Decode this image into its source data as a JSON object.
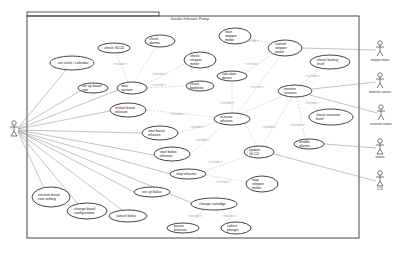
{
  "diagram": {
    "type": "uml-use-case",
    "system_title": "Insulin Infusion Pump",
    "stereotype": "<<include>>",
    "actors": [
      {
        "id": "patient",
        "label": "",
        "x": 12,
        "y": 131
      },
      {
        "id": "stepper-motor",
        "label": "stepper motor",
        "x": 380,
        "y": 50
      },
      {
        "id": "batteries-sensor",
        "label": "batteries sensor",
        "x": 380,
        "y": 83
      },
      {
        "id": "reservoir-sensor",
        "label": "reservoir sensor",
        "x": 381,
        "y": 114
      },
      {
        "id": "alarms",
        "label": "alarms",
        "x": 380,
        "y": 149
      },
      {
        "id": "lcd",
        "label": "LCD",
        "x": 380,
        "y": 181
      }
    ],
    "use_cases": [
      {
        "id": "set-clock",
        "label": "set clock / calendar",
        "cx": 72,
        "cy": 63,
        "rx": 22,
        "ry": 7
      },
      {
        "id": "check-lcd",
        "label": "check GLCD",
        "cx": 114,
        "cy": 48,
        "rx": 16,
        "ry": 5
      },
      {
        "id": "check-alarms",
        "label": "check alarms",
        "cx": 160,
        "cy": 41,
        "rx": 15,
        "ry": 6
      },
      {
        "id": "start-stepper",
        "label": "start stepper motor",
        "cx": 235,
        "cy": 36,
        "rx": 16,
        "ry": 8
      },
      {
        "id": "check-stepper",
        "label": "check stepper motor",
        "cx": 200,
        "cy": 60,
        "rx": 16,
        "ry": 8
      },
      {
        "id": "control-stepper",
        "label": "control stepper motor",
        "cx": 285,
        "cy": 48,
        "rx": 17,
        "ry": 8
      },
      {
        "id": "setup-basal",
        "label": "set up basal rate",
        "cx": 93,
        "cy": 88,
        "rx": 15,
        "ry": 5
      },
      {
        "id": "start-system",
        "label": "start system",
        "cx": 132,
        "cy": 88,
        "rx": 15,
        "ry": 6
      },
      {
        "id": "check-batteries",
        "label": "check batteries",
        "cx": 200,
        "cy": 86,
        "rx": 14,
        "ry": 5
      },
      {
        "id": "calculate-dose",
        "label": "calculate doses",
        "cx": 232,
        "cy": 76,
        "rx": 15,
        "ry": 5
      },
      {
        "id": "check-battery-level",
        "label": "check battery level",
        "cx": 330,
        "cy": 62,
        "rx": 20,
        "ry": 7
      },
      {
        "id": "restart-basal",
        "label": "restart basal infusion",
        "cx": 128,
        "cy": 110,
        "rx": 18,
        "ry": 7
      },
      {
        "id": "monitor-sensors",
        "label": "monitor sensors",
        "cx": 295,
        "cy": 91,
        "rx": 17,
        "ry": 6
      },
      {
        "id": "check-reservoir",
        "label": "check reservoir level",
        "cx": 331,
        "cy": 117,
        "rx": 22,
        "ry": 8
      },
      {
        "id": "start-basal",
        "label": "start basal infusion",
        "cx": 160,
        "cy": 133,
        "rx": 18,
        "ry": 7
      },
      {
        "id": "activate-infusion",
        "label": "activate infusion",
        "cx": 232,
        "cy": 119,
        "rx": 18,
        "ry": 6
      },
      {
        "id": "start-bolus",
        "label": "start bolus infusion",
        "cx": 172,
        "cy": 154,
        "rx": 18,
        "ry": 7
      },
      {
        "id": "update-lcd",
        "label": "update GLCD",
        "cx": 259,
        "cy": 152,
        "rx": 15,
        "ry": 6
      },
      {
        "id": "enable-alarms",
        "label": "enable alarms",
        "cx": 309,
        "cy": 144,
        "rx": 15,
        "ry": 5
      },
      {
        "id": "stop-infusion",
        "label": "stop infusion",
        "cx": 188,
        "cy": 174,
        "rx": 18,
        "ry": 5
      },
      {
        "id": "stop-stepper",
        "label": "stop stepper motor",
        "cx": 262,
        "cy": 184,
        "rx": 16,
        "ry": 8
      },
      {
        "id": "setup-bolus",
        "label": "set up bolus",
        "cx": 152,
        "cy": 192,
        "rx": 18,
        "ry": 5
      },
      {
        "id": "change-cartridge",
        "label": "change cartridge",
        "cx": 214,
        "cy": 204,
        "rx": 23,
        "ry": 6
      },
      {
        "id": "retrieve-basal",
        "label": "retrieve basal rate setting",
        "cx": 51,
        "cy": 197,
        "rx": 19,
        "ry": 10
      },
      {
        "id": "change-basal-config",
        "label": "change basal configuration",
        "cx": 87,
        "cy": 211,
        "rx": 20,
        "ry": 8
      },
      {
        "id": "cancel-bolus",
        "label": "cancel bolus",
        "cx": 128,
        "cy": 216,
        "rx": 19,
        "ry": 6
      },
      {
        "id": "pause-infusion",
        "label": "pause infusion",
        "cx": 183,
        "cy": 228,
        "rx": 16,
        "ry": 5
      },
      {
        "id": "collect-plunger",
        "label": "collect plunger",
        "cx": 236,
        "cy": 228,
        "rx": 15,
        "ry": 6
      }
    ]
  }
}
